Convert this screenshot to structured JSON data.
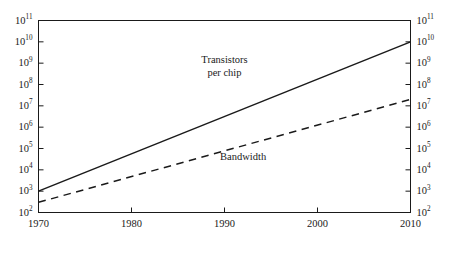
{
  "chart_data": {
    "type": "line",
    "title": "",
    "subtitle": "",
    "xlabel": "",
    "ylabel": "",
    "xlim": [
      1970,
      2010
    ],
    "ylim": [
      100,
      100000000000
    ],
    "yscale": "log",
    "xscale": "linear",
    "grid": false,
    "legend_position": "inline-annotation",
    "x_ticks": [
      {
        "value": 1970,
        "label": "1970"
      },
      {
        "value": 1980,
        "label": "1980"
      },
      {
        "value": 1990,
        "label": "1990"
      },
      {
        "value": 2000,
        "label": "2000"
      },
      {
        "value": 2010,
        "label": "2010"
      }
    ],
    "y_ticks": [
      {
        "value": 100000000000,
        "mantissa": "10",
        "exponent": "11"
      },
      {
        "value": 10000000000,
        "mantissa": "10",
        "exponent": "10"
      },
      {
        "value": 1000000000,
        "mantissa": "10",
        "exponent": "9"
      },
      {
        "value": 100000000,
        "mantissa": "10",
        "exponent": "8"
      },
      {
        "value": 10000000,
        "mantissa": "10",
        "exponent": "7"
      },
      {
        "value": 1000000,
        "mantissa": "10",
        "exponent": "6"
      },
      {
        "value": 100000,
        "mantissa": "10",
        "exponent": "5"
      },
      {
        "value": 10000,
        "mantissa": "10",
        "exponent": "4"
      },
      {
        "value": 1000,
        "mantissa": "10",
        "exponent": "3"
      },
      {
        "value": 100,
        "mantissa": "10",
        "exponent": "2"
      }
    ],
    "y_axis_right_mirrors_left": true,
    "series": [
      {
        "name": "Transistors per chip",
        "style": "solid",
        "color": "#1a1a1a",
        "x": [
          1970,
          2010
        ],
        "values": [
          1000,
          10000000000
        ],
        "annotation": {
          "line1": "Transistors",
          "line2": "per chip",
          "x": 1990,
          "y": 1000000000
        }
      },
      {
        "name": "Bandwidth",
        "style": "dashed",
        "color": "#1a1a1a",
        "x": [
          1970,
          2010
        ],
        "values": [
          300,
          20000000
        ],
        "annotation": {
          "line1": "Bandwidth",
          "line2": "",
          "x": 1992,
          "y": 30000
        }
      }
    ]
  },
  "figure": {
    "background_color": "#ffffff",
    "axis_color": "#1a1a1a",
    "text_color": "#1a1a1a"
  }
}
